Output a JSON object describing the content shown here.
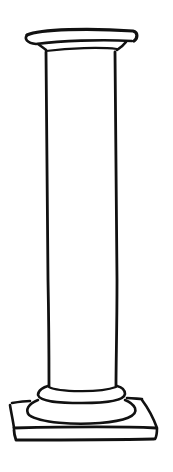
{
  "illustration": {
    "subject": "classical column",
    "style": "hand-drawn ink sketch",
    "parts": [
      "capital-abacus",
      "capital-echinus",
      "shaft",
      "base-torus",
      "base-disc",
      "plinth"
    ],
    "ink_color": "#111111",
    "background_color": "#ffffff"
  }
}
